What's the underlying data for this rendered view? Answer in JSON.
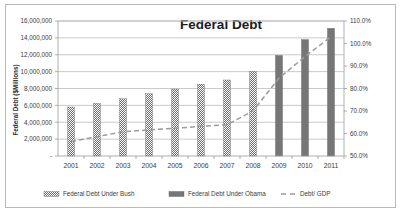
{
  "chart_data": {
    "type": "bar",
    "title": "Federal Debt",
    "xlabel": "",
    "ylabel": "Federal Debt ($Millions)",
    "y2label": "",
    "categories": [
      "2001",
      "2002",
      "2003",
      "2004",
      "2005",
      "2006",
      "2007",
      "2008",
      "2009",
      "2010",
      "2011"
    ],
    "ylim": [
      0,
      16000000
    ],
    "y2lim": [
      50,
      110
    ],
    "ytick_labels": [
      "16,000,000",
      "14,000,000",
      "12,000,000",
      "10,000,000",
      "8,000,000",
      "6,000,000",
      "4,000,000",
      "2,000,000",
      "-"
    ],
    "ytick_values": [
      16000000,
      14000000,
      12000000,
      10000000,
      8000000,
      6000000,
      4000000,
      2000000,
      0
    ],
    "y2tick_labels": [
      "110.0%",
      "100.0%",
      "90.0%",
      "80.0%",
      "70.0%",
      "60.0%",
      "50.0%"
    ],
    "y2tick_values": [
      110,
      100,
      90,
      80,
      70,
      60,
      50
    ],
    "grid": true,
    "legend_position": "bottom",
    "series": [
      {
        "name": "Federal Debt Under Bush",
        "type": "bar",
        "style": "hatched",
        "axis": "left",
        "color": "#767676",
        "values": [
          5807463,
          6228236,
          6783231,
          7379053,
          7932710,
          8507000,
          9007700,
          10024700,
          null,
          null,
          null
        ]
      },
      {
        "name": "Federal Debt Under Obama",
        "type": "bar",
        "style": "solid",
        "axis": "left",
        "color": "#767676",
        "values": [
          null,
          null,
          null,
          null,
          null,
          null,
          null,
          null,
          11909800,
          13786600,
          15125900
        ]
      },
      {
        "name": "Debt/ GDP",
        "type": "line",
        "style": "dashed",
        "axis": "right",
        "color": "#9c9c9c",
        "values": [
          56.4,
          58.6,
          60.8,
          61.6,
          62.3,
          63.2,
          63.9,
          70.0,
          84.6,
          94.2,
          103.0
        ]
      }
    ]
  },
  "legend": {
    "items": [
      {
        "label": "Federal Debt Under Bush",
        "marker": "hatched-swatch"
      },
      {
        "label": "Federal Debt Under Obama",
        "marker": "solid-swatch"
      },
      {
        "label": "Debt/ GDP",
        "marker": "dashed-line"
      }
    ]
  }
}
